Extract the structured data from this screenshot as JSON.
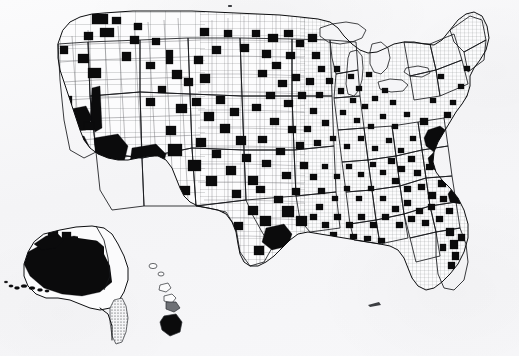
{
  "document": {
    "kind": "scanned-map-figure",
    "title": "",
    "caption": "",
    "legend": "",
    "source_note": "",
    "alt_text": "Black and white county-level map of the United States with scattered counties filled solid black, including insets of Alaska and Hawaii.",
    "has_visible_title": false,
    "has_visible_legend": false,
    "has_visible_caption": false
  },
  "canvas": {
    "width": 519,
    "height": 356,
    "background_color": "#f5f5f7",
    "page_tone": "off-white scanned paper"
  },
  "map": {
    "name": "united-states-county-choropleth",
    "projection_look": "albers-equal-area-conic",
    "units": "counties",
    "symbology": "two-class binary shading",
    "classes": [
      {
        "label": "",
        "fill_color": "#0b0b0c",
        "meaning": "shaded / selected county"
      },
      {
        "label": "",
        "fill_color": "#fcfcfd",
        "meaning": "unshaded county"
      }
    ],
    "line_colors": {
      "county_border": "#5d5f63",
      "state_border": "#16181b",
      "national_border": "#0d0e10",
      "lake_border": "#16181b"
    },
    "insets": [
      {
        "name": "alaska",
        "position": "lower-left",
        "shading": "mostly shaded black"
      },
      {
        "name": "hawaii",
        "position": "lower-center-left",
        "shading": "big island shaded black"
      }
    ],
    "regions_described": [
      {
        "name": "pacific-northwest",
        "shaded_density": "moderate"
      },
      {
        "name": "great-basin-and-southwest",
        "shaded_density": "high, large shaded counties"
      },
      {
        "name": "great-plains",
        "shaded_density": "low to moderate, isolated squares"
      },
      {
        "name": "midwest",
        "shaded_density": "moderate"
      },
      {
        "name": "appalachia-and-southeast",
        "shaded_density": "high, dense clusters"
      },
      {
        "name": "mid-atlantic-urban-corridor",
        "shaded_density": "very high, contiguous cluster"
      },
      {
        "name": "new-england",
        "shaded_density": "low"
      },
      {
        "name": "texas",
        "shaded_density": "moderate, clustered east and south"
      },
      {
        "name": "florida",
        "shaded_density": "moderate along peninsula"
      }
    ],
    "shaded_county_count_estimate": 430
  },
  "chart_data": {
    "type": "heatmap",
    "title": "",
    "xlabel": "",
    "ylabel": "",
    "grid": false,
    "legend_position": "none",
    "value_scale": [
      "unshaded",
      "shaded"
    ],
    "categories": [
      "Pacific Northwest",
      "California / Great Basin",
      "Southwest",
      "Northern Rockies",
      "Great Plains",
      "Upper Midwest",
      "Lower Midwest",
      "Appalachia",
      "Southeast",
      "Mid-Atlantic",
      "New England",
      "Texas",
      "Florida",
      "Alaska",
      "Hawaii"
    ],
    "values": [
      32,
      48,
      26,
      29,
      38,
      34,
      41,
      52,
      61,
      44,
      9,
      35,
      18,
      14,
      1
    ]
  },
  "artifacts": {
    "scan_specks": [
      {
        "x": 228,
        "y": 5,
        "w": 4,
        "h": 2
      },
      {
        "x": 368,
        "y": 303,
        "w": 13,
        "h": 4
      }
    ]
  }
}
